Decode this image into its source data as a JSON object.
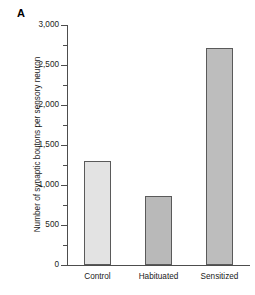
{
  "panel": {
    "label": "A"
  },
  "chart_data": {
    "type": "bar",
    "title": "",
    "xlabel": "",
    "ylabel": "Number of synaptic boutons per sensory neuron",
    "categories": [
      "Control",
      "Habituated",
      "Sensitized"
    ],
    "values": [
      1300,
      860,
      2710
    ],
    "ylim": [
      0,
      3000
    ],
    "ytick_values": [
      0,
      500,
      1000,
      1500,
      2000,
      2500,
      3000
    ],
    "ytick_labels": [
      "0",
      "500",
      "1,000",
      "1,500",
      "2,000",
      "2,500",
      "3,000"
    ],
    "yminor_tick_values": [
      250,
      750,
      1250,
      1750,
      2250,
      2750
    ],
    "grid": false,
    "legend": null,
    "bar_colors": [
      "#e3e3e3",
      "#b9b9b9",
      "#bdbdbd"
    ],
    "bar_edge_color": "#5a5a5a",
    "axis_color": "#4d4d4d"
  }
}
